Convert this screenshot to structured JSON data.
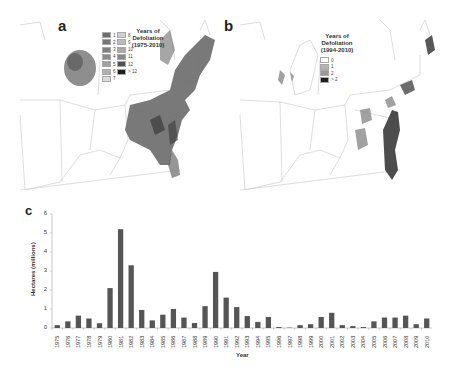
{
  "figure": {
    "panels": {
      "a": {
        "label": "a",
        "legend": {
          "title_line1": "Years of",
          "title_line2": "Defoliation",
          "title_line3": "(1975-2010)",
          "entries": [
            {
              "label": "1",
              "color": "#6e6e6e"
            },
            {
              "label": "2",
              "color": "#777777"
            },
            {
              "label": "3",
              "color": "#808080"
            },
            {
              "label": "4",
              "color": "#8c8c8c"
            },
            {
              "label": "5",
              "color": "#a0a0a0"
            },
            {
              "label": "6",
              "color": "#b0b0b0"
            },
            {
              "label": "7",
              "color": "#dcdcdc"
            },
            {
              "label": "8",
              "color": "#cfcfcf"
            },
            {
              "label": "9",
              "color": "#bcbcbc"
            },
            {
              "label": "10",
              "color": "#a8a8a8"
            },
            {
              "label": "11",
              "color": "#8a8a8a"
            },
            {
              "label": "12",
              "color": "#505050"
            },
            {
              "label": "> 12",
              "color": "#1e1e1e"
            }
          ]
        }
      },
      "b": {
        "label": "b",
        "legend": {
          "title_line1": "Years of",
          "title_line2": "Defoliation",
          "title_line3": "(1994-2010)",
          "entries": [
            {
              "label": "0",
              "color": "#ffffff"
            },
            {
              "label": "1",
              "color": "#b4b4b4"
            },
            {
              "label": "2",
              "color": "#9a9a9a"
            },
            {
              "label": "> 2",
              "color": "#1e1e1e"
            }
          ]
        }
      },
      "c": {
        "label": "c"
      }
    }
  },
  "chart_data": {
    "type": "bar",
    "title": "",
    "xlabel": "Year",
    "ylabel": "Hectares (millions)",
    "ylim": [
      0,
      6
    ],
    "yticks": [
      "0",
      "1",
      "2",
      "3",
      "4",
      "5",
      "6"
    ],
    "grid": false,
    "legend": "none",
    "bar_color": "#555555",
    "categories": [
      "1975",
      "1976",
      "1977",
      "1978",
      "1979",
      "1980",
      "1981",
      "1982",
      "1983",
      "1984",
      "1985",
      "1986",
      "1987",
      "1988",
      "1989",
      "1990",
      "1991",
      "1992",
      "1993",
      "1994",
      "1995",
      "1996",
      "1997",
      "1998",
      "1999",
      "2000",
      "2001",
      "2002",
      "2003",
      "2004",
      "2005",
      "2006",
      "2007",
      "2008",
      "2009",
      "2010"
    ],
    "values": [
      0.15,
      0.35,
      0.65,
      0.5,
      0.25,
      2.1,
      5.2,
      3.3,
      0.95,
      0.4,
      0.7,
      1.0,
      0.55,
      0.26,
      1.15,
      2.95,
      1.6,
      1.1,
      0.63,
      0.32,
      0.58,
      0.05,
      0.02,
      0.15,
      0.2,
      0.58,
      0.8,
      0.15,
      0.1,
      0.05,
      0.35,
      0.55,
      0.55,
      0.65,
      0.2,
      0.5
    ]
  }
}
